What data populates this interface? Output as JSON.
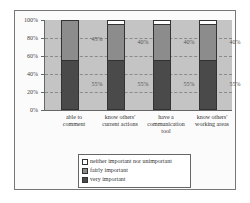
{
  "chart_data": {
    "type": "bar",
    "stacked": true,
    "percent": true,
    "title": "",
    "xlabel": "",
    "ylabel": "",
    "ylim": [
      0,
      100
    ],
    "yticks": [
      "0%",
      "20%",
      "40%",
      "60%",
      "80%",
      "100%"
    ],
    "grid": "dashed horizontal",
    "legend_position": "bottom-center",
    "categories": [
      [
        "able to",
        "comment"
      ],
      [
        "know others'",
        "current actions"
      ],
      [
        "have a",
        "communication",
        "tool"
      ],
      [
        "know others'",
        "working areas"
      ]
    ],
    "series": [
      {
        "name": "very important",
        "color": "#4a4a4a",
        "values": [
          55,
          55,
          55,
          55
        ]
      },
      {
        "name": "fairly important",
        "color": "#8c8c8c",
        "values": [
          45,
          40,
          40,
          40
        ]
      },
      {
        "name": "neither important nor unimportant",
        "color": "#ffffff",
        "values": [
          0,
          5,
          5,
          5
        ]
      }
    ],
    "data_labels": {
      "very important": [
        "55%",
        "55%",
        "55%",
        "55%"
      ],
      "fairly important": [
        "45%",
        "40%",
        "40%",
        "40%"
      ]
    }
  },
  "legend": {
    "items": [
      {
        "label": "neither important nor unimportant",
        "color": "#ffffff"
      },
      {
        "label": "fairly important",
        "color": "#8c8c8c"
      },
      {
        "label": "very important",
        "color": "#4a4a4a"
      }
    ]
  }
}
